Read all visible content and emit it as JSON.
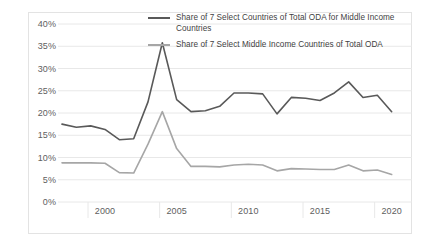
{
  "chart_data": {
    "type": "line",
    "title": "",
    "xlabel": "",
    "ylabel": "",
    "grid": true,
    "legend_position": "top-right",
    "xlim": [
      1997,
      2021
    ],
    "ylim": [
      0,
      40
    ],
    "y_ticks": [
      "0%",
      "5%",
      "10%",
      "15%",
      "20%",
      "25%",
      "30%",
      "35%",
      "40%"
    ],
    "y_tick_values": [
      0,
      5,
      10,
      15,
      20,
      25,
      30,
      35,
      40
    ],
    "x_ticks": [
      "2000",
      "2005",
      "2010",
      "2015",
      "2020"
    ],
    "x_tick_values": [
      2000,
      2005,
      2010,
      2015,
      2020
    ],
    "x": [
      1997,
      1998,
      1999,
      2000,
      2001,
      2002,
      2003,
      2004,
      2005,
      2006,
      2007,
      2008,
      2009,
      2010,
      2011,
      2012,
      2013,
      2014,
      2015,
      2016,
      2017,
      2018,
      2019,
      2020
    ],
    "series": [
      {
        "name": "Share of 7 Select Countries of Total ODA for Middle Income Countries",
        "color": "#595959",
        "values": [
          17.5,
          16.8,
          17.1,
          16.3,
          14.0,
          14.2,
          22.5,
          35.8,
          23.0,
          20.3,
          20.5,
          21.5,
          24.5,
          24.5,
          24.3,
          19.8,
          23.5,
          23.3,
          22.8,
          24.5,
          27.0,
          23.5,
          24.0,
          20.3
        ]
      },
      {
        "name": "Share of 7 Select Middle Income Countries of Total ODA",
        "color": "#a6a6a6",
        "values": [
          8.8,
          8.8,
          8.8,
          8.7,
          6.6,
          6.5,
          13.0,
          20.3,
          12.0,
          8.0,
          8.0,
          7.9,
          8.3,
          8.5,
          8.3,
          7.0,
          7.5,
          7.4,
          7.3,
          7.3,
          8.3,
          7.0,
          7.2,
          6.2
        ]
      }
    ]
  },
  "legend": {
    "entries": [
      {
        "label": "Share of 7 Select Countries of Total ODA for Middle Income Countries",
        "color": "#595959"
      },
      {
        "label": "Share of 7 Select Middle Income Countries of Total ODA",
        "color": "#a6a6a6"
      }
    ]
  },
  "colors": {
    "series_dark": "#595959",
    "series_light": "#a6a6a6",
    "gridline": "#e8e8e8",
    "frame": "#e3e3e3",
    "axis_text": "#606060",
    "legend_text": "#3f3f3f",
    "background": "#ffffff"
  }
}
